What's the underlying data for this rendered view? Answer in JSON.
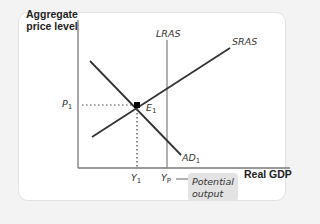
{
  "diagram": {
    "type": "AD-AS model",
    "y_axis_label": "Aggregate price level",
    "x_axis_label": "Real GDP",
    "curves": {
      "lras": {
        "label": "LRAS"
      },
      "sras": {
        "label": "SRAS"
      },
      "ad": {
        "label": "AD",
        "sub": "1"
      }
    },
    "equilibrium": {
      "label": "E",
      "sub": "1"
    },
    "price_marker": {
      "label": "P",
      "sub": "1"
    },
    "output_marker": {
      "label": "Y",
      "sub": "1"
    },
    "potential_marker": {
      "label": "Y",
      "sub": "P"
    },
    "annotation": {
      "line1": "Potential",
      "line2": "output"
    },
    "colors": {
      "curve": "#333333",
      "lras": "#888888",
      "axis": "#777777",
      "annotation_bg": "#e3e3e3",
      "card_border": "#e2e2e2"
    }
  }
}
